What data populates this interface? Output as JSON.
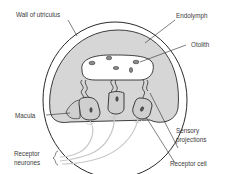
{
  "diagram": {
    "colors": {
      "outline": "#2a2a2a",
      "endolymph_fill": "#d6d6d6",
      "otolith_fill": "#ffffff",
      "cell_fill": "#cfcfcf",
      "neurone": "#c8c8c8",
      "label_text": "#3a3a3a"
    },
    "labels": {
      "wall": "Wall of utriculus",
      "endolymph": "Endolymph",
      "otolith": "Otolith",
      "macula": "Macula",
      "sensory_1": "Sensory",
      "sensory_2": "projections",
      "receptor_neurones_1": "Receptor",
      "receptor_neurones_2": "neurones",
      "receptor_cell": "Receptor cell"
    }
  }
}
